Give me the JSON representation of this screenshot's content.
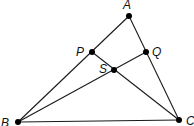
{
  "diagram": {
    "type": "triangle-with-cevians",
    "points": {
      "A": {
        "label": "A",
        "x": 129,
        "y": 16,
        "lx": 123,
        "ly": 9
      },
      "P": {
        "label": "P",
        "x": 92,
        "y": 52,
        "lx": 76,
        "ly": 56
      },
      "Q": {
        "label": "Q",
        "x": 146,
        "y": 52,
        "lx": 152,
        "ly": 56
      },
      "S": {
        "label": "S",
        "x": 114,
        "y": 70,
        "lx": 99,
        "ly": 73
      },
      "B": {
        "label": "B",
        "x": 18,
        "y": 122,
        "lx": 1,
        "ly": 127
      },
      "C": {
        "label": "C",
        "x": 179,
        "y": 120,
        "lx": 186,
        "ly": 125
      }
    },
    "segments": [
      [
        "A",
        "B"
      ],
      [
        "A",
        "C"
      ],
      [
        "B",
        "C"
      ],
      [
        "P",
        "C"
      ],
      [
        "B",
        "Q"
      ]
    ],
    "colors": {
      "line": "#1a1a1a",
      "point": "#000000",
      "label": "#111111"
    }
  }
}
